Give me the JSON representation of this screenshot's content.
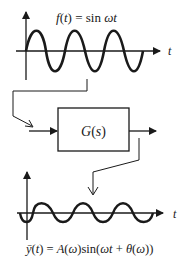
{
  "diagram": {
    "colors": {
      "stroke": "#1a1a1a",
      "background": "#ffffff"
    },
    "input_plot": {
      "formula": "f(t) = sin ωt",
      "axis_label": "t",
      "amplitude": 1,
      "periods": 3
    },
    "system_block": {
      "label": "G(s)"
    },
    "output_plot": {
      "formula": "ȳ(t) = A(ω)sin(ωt + θ(ω))",
      "axis_label": "t",
      "amplitude": 0.55,
      "periods": 3
    }
  }
}
